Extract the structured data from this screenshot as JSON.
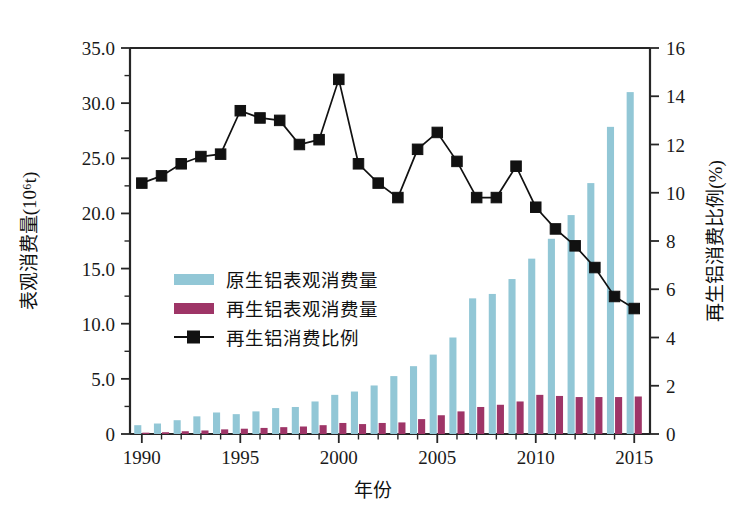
{
  "chart_data": {
    "type": "bar",
    "title": "",
    "xlabel": "年份",
    "ylabel": "表观消费量(10⁶t)",
    "y2label": "再生铝消费比例(%)",
    "grid": false,
    "legend_position": "inside-left",
    "categories": [
      1990,
      1991,
      1992,
      1993,
      1994,
      1995,
      1996,
      1997,
      1998,
      1999,
      2000,
      2001,
      2002,
      2003,
      2004,
      2005,
      2006,
      2007,
      2008,
      2009,
      2010,
      2011,
      2012,
      2013,
      2014,
      2015
    ],
    "xtick_labels": [
      "1990",
      "1995",
      "2000",
      "2005",
      "2010",
      "2015"
    ],
    "xtick_values": [
      1990,
      1995,
      2000,
      2005,
      2010,
      2015
    ],
    "xlim": [
      1989.4,
      2015.8
    ],
    "ytick_labels": [
      "0",
      "5.0",
      "10.0",
      "15.0",
      "20.0",
      "25.0",
      "30.0",
      "35.0"
    ],
    "ytick_values": [
      0,
      5,
      10,
      15,
      20,
      25,
      30,
      35
    ],
    "ylim": [
      0,
      35
    ],
    "y2tick_labels": [
      "0",
      "2",
      "4",
      "6",
      "8",
      "10",
      "12",
      "14",
      "16"
    ],
    "y2tick_values": [
      0,
      2,
      4,
      6,
      8,
      10,
      12,
      14,
      16
    ],
    "y2lim": [
      0,
      16
    ],
    "series": [
      {
        "name": "原生铝表观消费量",
        "kind": "bar",
        "axis": "left",
        "color": "#92c7d6",
        "values": [
          0.8,
          0.95,
          1.25,
          1.6,
          1.95,
          1.8,
          2.05,
          2.35,
          2.45,
          2.95,
          3.55,
          3.85,
          4.4,
          5.25,
          6.15,
          7.2,
          8.75,
          12.3,
          12.7,
          14.05,
          15.9,
          17.7,
          19.85,
          22.75,
          27.85,
          31.0
        ]
      },
      {
        "name": "再生铝表观消费量",
        "kind": "bar",
        "axis": "left",
        "color": "#9e3567",
        "values": [
          0.12,
          0.16,
          0.25,
          0.32,
          0.42,
          0.48,
          0.55,
          0.62,
          0.68,
          0.8,
          1.0,
          0.9,
          1.0,
          1.05,
          1.35,
          1.7,
          2.05,
          2.45,
          2.65,
          2.95,
          3.55,
          3.45,
          3.35,
          3.35,
          3.35,
          3.4
        ]
      },
      {
        "name": "再生铝消费比例",
        "kind": "line",
        "axis": "right",
        "color": "#111111",
        "marker": "square",
        "values": [
          10.4,
          10.7,
          11.2,
          11.5,
          11.6,
          13.4,
          13.1,
          13.0,
          12.0,
          12.2,
          14.7,
          11.2,
          10.4,
          9.8,
          11.8,
          12.5,
          11.3,
          9.8,
          9.8,
          11.1,
          9.4,
          8.5,
          7.8,
          6.9,
          5.7,
          5.2
        ]
      }
    ],
    "legend": [
      {
        "label": "原生铝表观消费量",
        "type": "swatch",
        "color": "#92c7d6"
      },
      {
        "label": "再生铝表观消费量",
        "type": "swatch",
        "color": "#9e3567"
      },
      {
        "label": "再生铝消费比例",
        "type": "line-marker",
        "color": "#111111"
      }
    ]
  }
}
